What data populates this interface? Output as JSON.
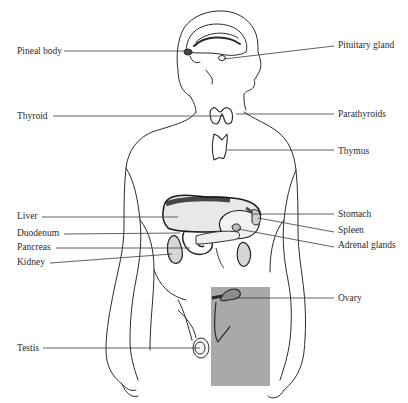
{
  "diagram": {
    "type": "anatomical-illustration",
    "highlight_box_color": "#a9a9a9",
    "line_color": "#333333"
  },
  "labels_left": [
    {
      "text": "Pineal body",
      "x": 17,
      "y": 46,
      "line": [
        64,
        51,
        186,
        51
      ]
    },
    {
      "text": "Thyroid",
      "x": 17,
      "y": 111,
      "line": [
        53,
        116,
        222,
        116
      ]
    },
    {
      "text": "Liver",
      "x": 17,
      "y": 211,
      "line": [
        42,
        216,
        178,
        217
      ]
    },
    {
      "text": "Duodenum",
      "x": 17,
      "y": 228,
      "line": [
        64,
        234,
        180,
        233
      ]
    },
    {
      "text": "Pancreas",
      "x": 17,
      "y": 242,
      "line": [
        56,
        248,
        190,
        248
      ]
    },
    {
      "text": "Kidney",
      "x": 17,
      "y": 257,
      "line": [
        50,
        263,
        172,
        254
      ]
    },
    {
      "text": "Testis",
      "x": 17,
      "y": 343,
      "line": [
        43,
        348,
        200,
        348
      ]
    }
  ],
  "labels_right": [
    {
      "text": "Pituitary gland",
      "x": 338,
      "y": 40,
      "line": [
        224,
        59,
        334,
        46
      ]
    },
    {
      "text": "Parathyroids",
      "x": 338,
      "y": 109,
      "line": [
        236,
        114,
        334,
        114
      ]
    },
    {
      "text": "Thymus",
      "x": 338,
      "y": 146,
      "line": [
        227,
        150,
        334,
        150
      ]
    },
    {
      "text": "Stomach",
      "x": 338,
      "y": 209,
      "line": [
        253,
        214,
        334,
        214
      ]
    },
    {
      "text": "Spleen",
      "x": 338,
      "y": 225,
      "line": [
        258,
        218,
        334,
        232
      ]
    },
    {
      "text": "Adrenal glands",
      "x": 338,
      "y": 240,
      "line": [
        238,
        229,
        334,
        247
      ]
    },
    {
      "text": "Ovary",
      "x": 338,
      "y": 293,
      "line": [
        238,
        298,
        334,
        298
      ]
    }
  ]
}
